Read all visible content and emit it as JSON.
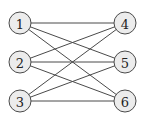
{
  "diagram": {
    "type": "bipartite-graph",
    "left_nodes": [
      {
        "id": "1",
        "label": "1",
        "x": 20,
        "y": 23
      },
      {
        "id": "2",
        "label": "2",
        "x": 20,
        "y": 62
      },
      {
        "id": "3",
        "label": "3",
        "x": 20,
        "y": 101
      }
    ],
    "right_nodes": [
      {
        "id": "4",
        "label": "4",
        "x": 125,
        "y": 23
      },
      {
        "id": "5",
        "label": "5",
        "x": 125,
        "y": 62
      },
      {
        "id": "6",
        "label": "6",
        "x": 125,
        "y": 101
      }
    ],
    "edges": [
      [
        "1",
        "4"
      ],
      [
        "1",
        "5"
      ],
      [
        "1",
        "6"
      ],
      [
        "2",
        "4"
      ],
      [
        "2",
        "5"
      ],
      [
        "2",
        "6"
      ],
      [
        "3",
        "4"
      ],
      [
        "3",
        "5"
      ],
      [
        "3",
        "6"
      ]
    ],
    "node_radius": 11,
    "colors": {
      "node_fill": "#ececec",
      "stroke": "#4a4a4a",
      "label": "#222222",
      "background": "#ffffff"
    }
  }
}
